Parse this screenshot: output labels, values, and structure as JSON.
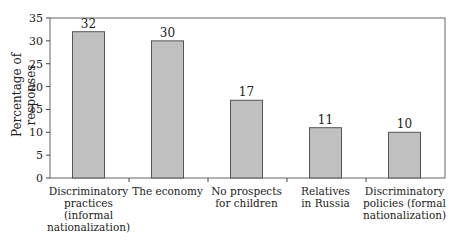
{
  "chart_data": {
    "type": "bar",
    "title": "",
    "xlabel": "",
    "ylabel": "Percentage of responses",
    "ylim": [
      0,
      35
    ],
    "yticks": [
      0,
      5,
      10,
      15,
      20,
      25,
      30,
      35
    ],
    "grid": false,
    "legend": null,
    "categories": [
      "Discriminatory practices (informal nationalization)",
      "The economy",
      "No prospects for children",
      "Relatives in Russia",
      "Discriminatory policies (formal nationalization)"
    ],
    "category_lines": [
      [
        "Discriminatory",
        "practices",
        "(informal",
        "nationalization)"
      ],
      [
        "The economy"
      ],
      [
        "No prospects",
        "for children"
      ],
      [
        "Relatives",
        "in Russia"
      ],
      [
        "Discriminatory",
        "policies (formal",
        "nationalization)"
      ]
    ],
    "values": [
      32,
      30,
      17,
      11,
      10
    ],
    "data_labels": [
      "32",
      "30",
      "17",
      "11",
      "10"
    ],
    "bar_color": "#c0c0c0",
    "bar_edge_color": "#555555"
  }
}
